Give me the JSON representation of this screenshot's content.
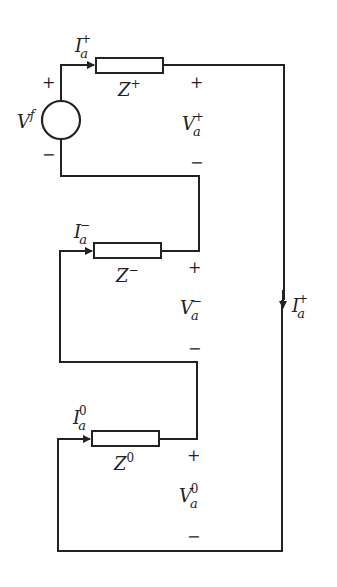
{
  "diagram": {
    "type": "sequence-network-series-connection",
    "source": {
      "label": "V",
      "sup": "f",
      "plus": "+",
      "minus": "−"
    },
    "branches": [
      {
        "name": "positive",
        "current": {
          "label": "I",
          "sub": "a",
          "sup": "+"
        },
        "impedance": {
          "label": "Z",
          "sup": "+"
        },
        "voltage": {
          "label": "V",
          "sub": "a",
          "sup": "+"
        },
        "plus": "+",
        "minus": "−"
      },
      {
        "name": "negative",
        "current": {
          "label": "I",
          "sub": "a",
          "sup": "−"
        },
        "impedance": {
          "label": "Z",
          "sup": "−"
        },
        "voltage": {
          "label": "V",
          "sub": "a",
          "sup": "−"
        },
        "plus": "+",
        "minus": "−"
      },
      {
        "name": "zero",
        "current": {
          "label": "I",
          "sub": "a",
          "sup": "0"
        },
        "impedance": {
          "label": "Z",
          "sup": "0"
        },
        "voltage": {
          "label": "V",
          "sub": "a",
          "sup": "0"
        },
        "plus": "+",
        "minus": "−"
      }
    ],
    "return_current": {
      "label": "I",
      "sub": "a",
      "sup": "+"
    },
    "colors": {
      "line": "#222222",
      "background": "#ffffff"
    }
  }
}
